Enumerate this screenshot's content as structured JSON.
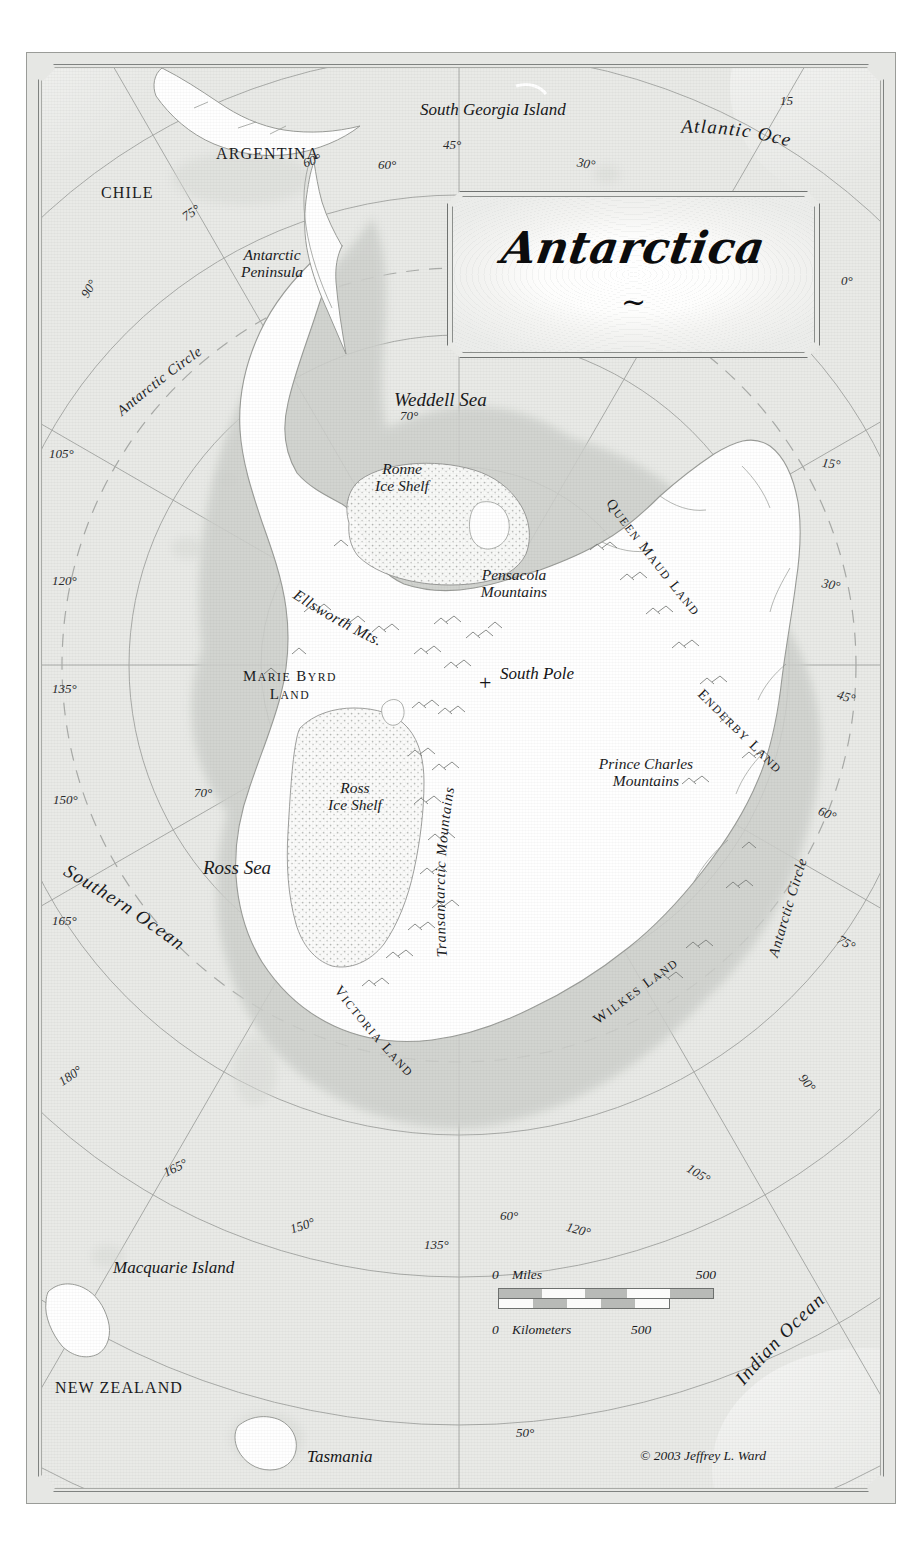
{
  "map": {
    "title": "Antarctica",
    "title_flourish": "~",
    "credit": "© 2003 Jeffrey L. Ward",
    "background_color": "#e9eae7",
    "ice_color": "#ffffff",
    "shelf_color": "#f7f8f6",
    "coast_color": "#9b9d99"
  },
  "countries": [
    {
      "name": "CHILE",
      "x": 101,
      "y": 125
    },
    {
      "name": "ARGENTINA",
      "x": 216,
      "y": 86
    },
    {
      "name": "NEW ZEALAND",
      "x": 55,
      "y": 1320
    }
  ],
  "oceans": [
    {
      "name": "Atlantic Ocean",
      "x": 677,
      "y": 113,
      "rotate": -14
    },
    {
      "name": "Southern Ocean",
      "x": 55,
      "y": 868,
      "rotate": 36
    },
    {
      "name": "Indian Ocean",
      "x": 733,
      "y": 1314,
      "rotate": -40
    }
  ],
  "seas": [
    {
      "name": "Weddell Sea",
      "x": 393,
      "y": 382,
      "rotate": -6
    },
    {
      "name": "Ross Sea",
      "x": 203,
      "y": 850,
      "rotate": 0
    }
  ],
  "islands": [
    {
      "name": "South Georgia Island",
      "x": 420,
      "y": 93
    },
    {
      "name": "Macquarie Island",
      "x": 113,
      "y": 1251
    },
    {
      "name": "Tasmania",
      "x": 307,
      "y": 1440
    }
  ],
  "features": [
    {
      "name": "Antarctic\nPeninsula",
      "x": 227,
      "y": 248
    },
    {
      "name": "Ronne\nIce Shelf",
      "x": 357,
      "y": 460
    },
    {
      "name": "Pensacola\nMountains",
      "x": 468,
      "y": 566
    },
    {
      "name": "Ross\nIce Shelf",
      "x": 311,
      "y": 779
    },
    {
      "name": "Prince Charles\nMountains",
      "x": 599,
      "y": 755
    }
  ],
  "curved_features": [
    {
      "name": "Ellsworth Mts.",
      "path": "ellsworth"
    },
    {
      "name": "Transantarctic Mountains",
      "path": "transantarctic"
    }
  ],
  "regions": [
    {
      "name": "MARIE BYRD\nLAND",
      "x": 237,
      "y": 668
    },
    {
      "name": "QUEEN MAUD LAND",
      "path": "queenmaud"
    },
    {
      "name": "ENDERBY LAND",
      "path": "enderby"
    },
    {
      "name": "VICTORIA LAND",
      "path": "victoria"
    },
    {
      "name": "WILKES LAND",
      "path": "wilkes"
    }
  ],
  "pole": {
    "label": "South Pole",
    "x": 458,
    "y": 664,
    "marker": "+"
  },
  "antarctic_circle": [
    {
      "label": "Antarctic Circle",
      "x": 118,
      "y": 330,
      "rotate": 42
    },
    {
      "label": "Antarctic Circle",
      "x": 782,
      "y": 830,
      "rotate": -62
    }
  ],
  "meridian_labels": [
    {
      "value": "15",
      "x": 780,
      "y": 87
    },
    {
      "value": "0°",
      "x": 841,
      "y": 274
    },
    {
      "value": "15°",
      "x": 822,
      "y": 457
    },
    {
      "value": "30°",
      "x": 822,
      "y": 578
    },
    {
      "value": "45°",
      "x": 837,
      "y": 690
    },
    {
      "value": "60°",
      "x": 818,
      "y": 807
    },
    {
      "value": "75°",
      "x": 837,
      "y": 936
    },
    {
      "value": "90°",
      "x": 798,
      "y": 1076
    },
    {
      "value": "105°",
      "x": 686,
      "y": 1167
    },
    {
      "value": "120°",
      "x": 566,
      "y": 1223
    },
    {
      "value": "135°",
      "x": 424,
      "y": 1238
    },
    {
      "value": "150°",
      "x": 290,
      "y": 1219
    },
    {
      "value": "165°",
      "x": 163,
      "y": 1161
    },
    {
      "value": "180°",
      "x": 58,
      "y": 1069
    },
    {
      "value": "165°",
      "x": 52,
      "y": 914
    },
    {
      "value": "150°",
      "x": 53,
      "y": 793
    },
    {
      "value": "135°",
      "x": 52,
      "y": 682
    },
    {
      "value": "120°",
      "x": 52,
      "y": 574
    },
    {
      "value": "105°",
      "x": 49,
      "y": 447
    },
    {
      "value": "90°",
      "x": 80,
      "y": 282
    },
    {
      "value": "75°",
      "x": 182,
      "y": 206
    },
    {
      "value": "60°",
      "x": 303,
      "y": 154
    },
    {
      "value": "45°",
      "x": 443,
      "y": 138
    },
    {
      "value": "30°",
      "x": 577,
      "y": 157
    }
  ],
  "parallel_labels": [
    {
      "value": "60°",
      "x": 378,
      "y": 158
    },
    {
      "value": "70°",
      "x": 400,
      "y": 409
    },
    {
      "value": "70°",
      "x": 194,
      "y": 786
    },
    {
      "value": "60°",
      "x": 500,
      "y": 1209
    },
    {
      "value": "50°",
      "x": 516,
      "y": 1426
    }
  ],
  "scale": {
    "miles_zero": "0",
    "miles_label": "Miles",
    "miles_max": "500",
    "km_zero": "0",
    "km_label": "Kilometers",
    "km_max": "500"
  }
}
